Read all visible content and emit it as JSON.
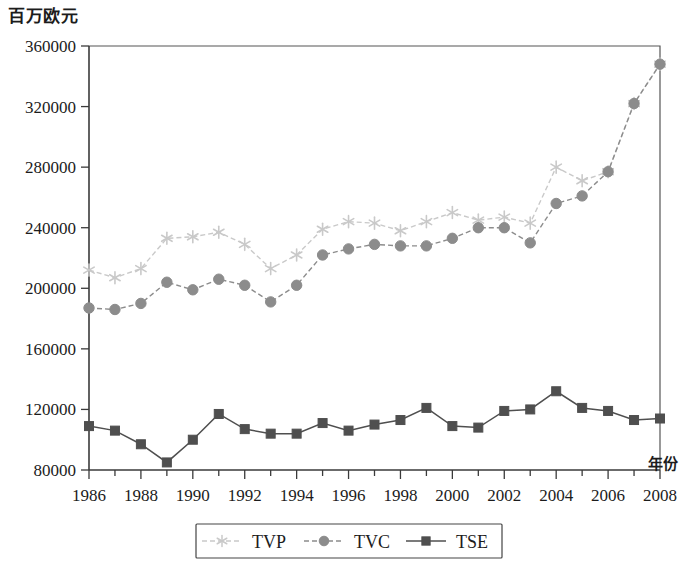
{
  "chart_data": {
    "type": "line",
    "title": "",
    "ylabel": "百万欧元",
    "xlabel": "年份",
    "x": [
      1986,
      1987,
      1988,
      1989,
      1990,
      1991,
      1992,
      1993,
      1994,
      1995,
      1996,
      1997,
      1998,
      1999,
      2000,
      2001,
      2002,
      2003,
      2004,
      2005,
      2006,
      2007,
      2008
    ],
    "xlim": [
      1986,
      2008
    ],
    "ylim": [
      80000,
      360000
    ],
    "ytick_values": [
      80000,
      120000,
      160000,
      200000,
      240000,
      280000,
      320000,
      360000
    ],
    "ytick_labels": [
      "80000",
      "120000",
      "160000",
      "200000",
      "240000",
      "280000",
      "320000",
      "360000"
    ],
    "xtick_values": [
      1986,
      1988,
      1990,
      1992,
      1994,
      1996,
      1998,
      2000,
      2002,
      2004,
      2006,
      2008
    ],
    "xtick_labels": [
      "1986",
      "1988",
      "1990",
      "1992",
      "1994",
      "1996",
      "1998",
      "2000",
      "2002",
      "2004",
      "2006",
      "2008"
    ],
    "xtick_minor": [
      1987,
      1989,
      1991,
      1993,
      1995,
      1997,
      1999,
      2001,
      2003,
      2005,
      2007
    ],
    "grid": false,
    "legend_position": "bottom",
    "series": [
      {
        "name": "TVP",
        "color": "#c9c9c9",
        "marker": "star",
        "linestyle": "dashed",
        "values": [
          212000,
          207000,
          213000,
          233000,
          234000,
          237000,
          229000,
          213000,
          222000,
          239000,
          244000,
          243000,
          238000,
          244000,
          250000,
          245000,
          247000,
          243000,
          280000,
          271000,
          277000,
          322000,
          348000
        ]
      },
      {
        "name": "TVC",
        "color": "#8c8c8c",
        "marker": "circle",
        "linestyle": "dashed",
        "values": [
          187000,
          186000,
          190000,
          204000,
          199000,
          206000,
          202000,
          191000,
          202000,
          222000,
          226000,
          229000,
          228000,
          228000,
          233000,
          240000,
          240000,
          230000,
          256000,
          261000,
          277000,
          322000,
          348000
        ]
      },
      {
        "name": "TSE",
        "color": "#4f4f4f",
        "marker": "square",
        "linestyle": "solid",
        "values": [
          109000,
          106000,
          97000,
          85000,
          100000,
          117000,
          107000,
          104000,
          104000,
          111000,
          106000,
          110000,
          113000,
          121000,
          109000,
          108000,
          119000,
          120000,
          132000,
          121000,
          119000,
          113000,
          114000
        ]
      }
    ]
  },
  "axis_labels": {
    "y_title": "百万欧元",
    "x_title": "年份"
  },
  "legend": {
    "items": [
      {
        "label": "TVP"
      },
      {
        "label": "TVC"
      },
      {
        "label": "TSE"
      }
    ]
  }
}
